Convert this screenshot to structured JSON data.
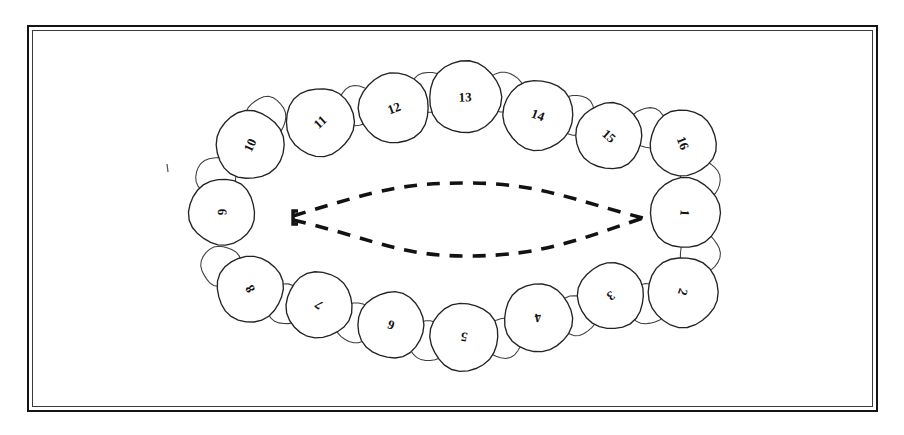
{
  "figure": {
    "name": "dental-arch-diagram",
    "ink_color": "#232323",
    "paper_color": "#ffffff",
    "frame": {
      "outer_color": "#141414",
      "inner_color": "#3a3a3a"
    }
  },
  "arch": {
    "dashed_outline": {
      "name": "tongue-outline",
      "style": "dashed",
      "color": "#121212",
      "left_tip_x": 293,
      "right_tip_x": 643,
      "center_y": 218
    },
    "teeth": [
      {
        "number": "1",
        "cx": 685,
        "cy": 213,
        "r": 35,
        "rotation": 95,
        "quadrant": "right"
      },
      {
        "number": "2",
        "cx": 683,
        "cy": 292,
        "r": 35,
        "rotation": 108,
        "quadrant": "lower-right"
      },
      {
        "number": "3",
        "cx": 611,
        "cy": 296,
        "r": 33,
        "rotation": 145,
        "quadrant": "lower-right"
      },
      {
        "number": "4",
        "cx": 538,
        "cy": 318,
        "r": 34,
        "rotation": 170,
        "quadrant": "lower-right"
      },
      {
        "number": "5",
        "cx": 464,
        "cy": 337,
        "r": 34,
        "rotation": 190,
        "quadrant": "lower-center"
      },
      {
        "number": "6",
        "cx": 391,
        "cy": 325,
        "r": 33,
        "rotation": 200,
        "quadrant": "lower-left"
      },
      {
        "number": "7",
        "cx": 319,
        "cy": 305,
        "r": 33,
        "rotation": 218,
        "quadrant": "lower-left"
      },
      {
        "number": "8",
        "cx": 250,
        "cy": 289,
        "r": 33,
        "rotation": 240,
        "quadrant": "lower-left"
      },
      {
        "number": "9",
        "cx": 222,
        "cy": 212,
        "r": 33,
        "rotation": 268,
        "quadrant": "left"
      },
      {
        "number": "10",
        "cx": 250,
        "cy": 145,
        "r": 34,
        "rotation": 295,
        "quadrant": "upper-left"
      },
      {
        "number": "11",
        "cx": 320,
        "cy": 122,
        "r": 34,
        "rotation": 318,
        "quadrant": "upper-left"
      },
      {
        "number": "12",
        "cx": 394,
        "cy": 108,
        "r": 35,
        "rotation": 340,
        "quadrant": "upper-left"
      },
      {
        "number": "13",
        "cx": 465,
        "cy": 97,
        "r": 36,
        "rotation": 358,
        "quadrant": "upper-center"
      },
      {
        "number": "14",
        "cx": 538,
        "cy": 115,
        "r": 35,
        "rotation": 20,
        "quadrant": "upper-right"
      },
      {
        "number": "15",
        "cx": 609,
        "cy": 136,
        "r": 33,
        "rotation": 42,
        "quadrant": "upper-right"
      },
      {
        "number": "16",
        "cx": 683,
        "cy": 143,
        "r": 33,
        "rotation": 68,
        "quadrant": "upper-right"
      }
    ],
    "interdental_marks": [
      {
        "cx": 700,
        "cy": 253,
        "r": 20
      },
      {
        "cx": 648,
        "cy": 304,
        "r": 20
      },
      {
        "cx": 577,
        "cy": 315,
        "r": 20
      },
      {
        "cx": 503,
        "cy": 338,
        "r": 20
      },
      {
        "cx": 428,
        "cy": 341,
        "r": 20
      },
      {
        "cx": 356,
        "cy": 323,
        "r": 20
      },
      {
        "cx": 286,
        "cy": 304,
        "r": 20
      },
      {
        "cx": 221,
        "cy": 266,
        "r": 20
      },
      {
        "cx": 216,
        "cy": 177,
        "r": 20
      },
      {
        "cx": 266,
        "cy": 117,
        "r": 20
      },
      {
        "cx": 357,
        "cy": 106,
        "r": 20
      },
      {
        "cx": 430,
        "cy": 92,
        "r": 20
      },
      {
        "cx": 503,
        "cy": 92,
        "r": 20
      },
      {
        "cx": 575,
        "cy": 115,
        "r": 20
      },
      {
        "cx": 648,
        "cy": 128,
        "r": 20
      },
      {
        "cx": 700,
        "cy": 180,
        "r": 20
      }
    ],
    "stray_mark": {
      "x": 167,
      "y": 168
    }
  },
  "chart_data": {
    "type": "diagram",
    "title": "",
    "tooth_numbers": [
      "1",
      "2",
      "3",
      "4",
      "5",
      "6",
      "7",
      "8",
      "9",
      "10",
      "11",
      "12",
      "13",
      "14",
      "15",
      "16"
    ],
    "count": 16
  }
}
